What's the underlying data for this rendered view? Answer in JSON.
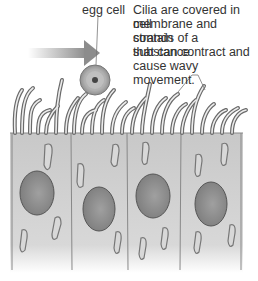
{
  "labels": {
    "egg_cell": "egg cell",
    "cilia_desc": [
      "Cilia are covered in cell",
      "membrane and contain",
      "strands of a substance",
      "that can contract and",
      "cause wavy movement."
    ]
  },
  "colors": {
    "cell_fill": "#cfcfcf",
    "nucleus": "#8a8a8a",
    "outline": "#707070",
    "arrow": "#9a9a9a"
  }
}
